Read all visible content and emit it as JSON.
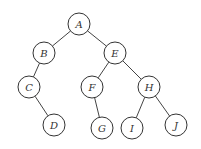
{
  "diagram": {
    "type": "binary-tree",
    "nodes": [
      {
        "id": "A",
        "label": "A"
      },
      {
        "id": "B",
        "label": "B"
      },
      {
        "id": "E",
        "label": "E"
      },
      {
        "id": "C",
        "label": "C"
      },
      {
        "id": "F",
        "label": "F"
      },
      {
        "id": "H",
        "label": "H"
      },
      {
        "id": "D",
        "label": "D"
      },
      {
        "id": "G",
        "label": "G"
      },
      {
        "id": "I",
        "label": "I"
      },
      {
        "id": "J",
        "label": "J"
      }
    ],
    "edges": [
      {
        "from": "A",
        "to": "B",
        "side": "left"
      },
      {
        "from": "A",
        "to": "E",
        "side": "right"
      },
      {
        "from": "B",
        "to": "C",
        "side": "left"
      },
      {
        "from": "C",
        "to": "D",
        "side": "right"
      },
      {
        "from": "E",
        "to": "F",
        "side": "left"
      },
      {
        "from": "E",
        "to": "H",
        "side": "right"
      },
      {
        "from": "F",
        "to": "G",
        "side": "right"
      },
      {
        "from": "H",
        "to": "I",
        "side": "left"
      },
      {
        "from": "H",
        "to": "J",
        "side": "right"
      }
    ]
  }
}
